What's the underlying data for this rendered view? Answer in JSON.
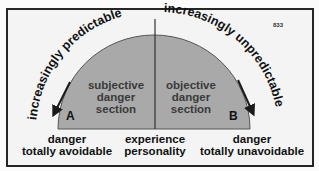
{
  "diagram": {
    "figure_number": "833",
    "arc_left_label": "increasingly predictable",
    "arc_right_label": "increasingly unpredictable",
    "left_section": {
      "letter": "A",
      "lines": [
        "subjective",
        "danger",
        "section"
      ]
    },
    "right_section": {
      "letter": "B",
      "lines": [
        "objective",
        "danger",
        "section"
      ]
    },
    "bottom_left": [
      "danger",
      "totally avoidable"
    ],
    "bottom_center": [
      "experience",
      "personality"
    ],
    "bottom_right": [
      "danger",
      "totally unavoidable"
    ],
    "colors": {
      "semicircle_fill": "#a9a9a9",
      "frame_border": "#262626",
      "background": "#f4f4f4",
      "text": "#111111"
    }
  }
}
